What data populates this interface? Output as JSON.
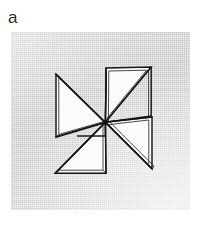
{
  "figure": {
    "panel_label": "a",
    "caption": "",
    "background_color": "#ffffff",
    "panel_color": "#d9d9d7",
    "ink_color": "#1a1a1a",
    "blade_fill_color": "#fbfbfa",
    "blade_count": 4,
    "blades": [
      {
        "name": "upper-left-blade",
        "orientation": "upper-left"
      },
      {
        "name": "upper-right-blade",
        "orientation": "upper-right"
      },
      {
        "name": "lower-right-blade",
        "orientation": "lower-right"
      },
      {
        "name": "lower-left-blade",
        "orientation": "lower-left"
      }
    ],
    "hub": {
      "name": "center-hub",
      "x": 94,
      "y": 90
    }
  }
}
